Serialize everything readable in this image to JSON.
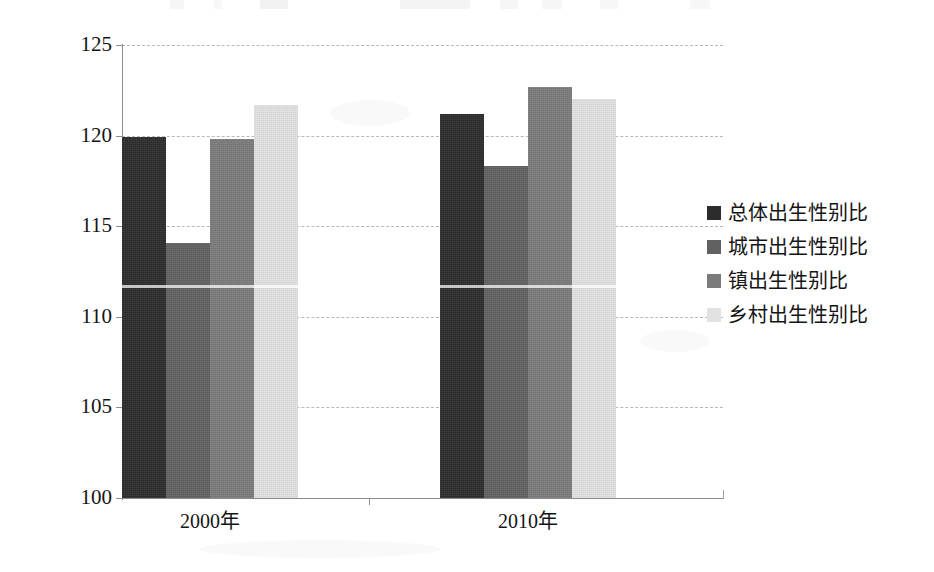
{
  "chart_data": {
    "type": "bar",
    "title": "",
    "subtitle": "",
    "xlabel": "",
    "ylabel": "",
    "categories": [
      "2000年",
      "2010年"
    ],
    "ylim": [
      100,
      125
    ],
    "ytick_step": 5,
    "yticks": [
      "100",
      "105",
      "110",
      "115",
      "120",
      "125"
    ],
    "grid": true,
    "legend_position": "right",
    "series": [
      {
        "name": "总体出生性别比",
        "color": "#2c2c2c",
        "values": [
          119.9,
          121.2
        ]
      },
      {
        "name": "城市出生性别比",
        "color": "#616161",
        "values": [
          114.1,
          118.3
        ]
      },
      {
        "name": "镇出生性别比",
        "color": "#7b7b7b",
        "values": [
          119.8,
          122.7
        ]
      },
      {
        "name": "乡村出生性别比",
        "color": "#e2e2e2",
        "values": [
          121.7,
          122.0
        ]
      }
    ]
  },
  "legend": {
    "items": [
      {
        "label": "总体出生性别比",
        "color": "#2c2c2c"
      },
      {
        "label": "城市出生性别比",
        "color": "#616161"
      },
      {
        "label": "镇出生性别比",
        "color": "#7b7b7b"
      },
      {
        "label": "乡村出生性别比",
        "color": "#e2e2e2"
      }
    ]
  },
  "axes": {
    "y_ticks": [
      "125",
      "120",
      "115",
      "110",
      "105",
      "100"
    ],
    "x_ticks": [
      "2000年",
      "2010年"
    ]
  }
}
